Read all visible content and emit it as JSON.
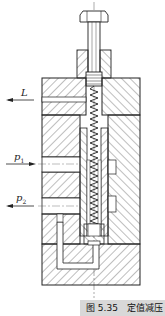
{
  "figure": {
    "type": "sectional drawing of constant-value pressure reducing valve",
    "caption": "图 5.35　定值减压",
    "labels": {
      "L": "L",
      "p1_main": "p",
      "p1_sub": "1",
      "p2_main": "p",
      "p2_sub": "2"
    },
    "ports": [
      {
        "name": "L",
        "direction": "out"
      },
      {
        "name": "p1",
        "direction": "in"
      },
      {
        "name": "p2",
        "direction": "out"
      }
    ],
    "colors": {
      "line": "#222222",
      "hatch": "#444444",
      "caption_bg": "#d8d8d8"
    }
  }
}
